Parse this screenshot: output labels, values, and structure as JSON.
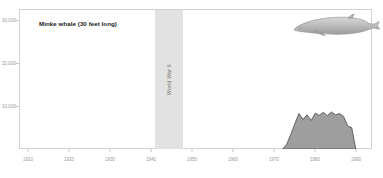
{
  "chart_title": "Minke whale (30 feet long)",
  "annotations": {
    "war_band_label": "World War II",
    "war_band_start": 1940,
    "war_band_end": 1946
  },
  "illustration": {
    "name": "minke-whale-illustration",
    "body_color": "#b4b4b4",
    "outline_color": "#8a8a8a"
  },
  "axes": {
    "y_ticks": [
      "30,000",
      "20,000",
      "10,000"
    ],
    "y_tick_values": [
      30000,
      20000,
      10000
    ],
    "x_ticks": [
      "1910",
      "1920",
      "1930",
      "1940",
      "1950",
      "1960",
      "1970",
      "1980",
      "1990"
    ],
    "x_tick_values": [
      1910,
      1920,
      1930,
      1940,
      1950,
      1960,
      1970,
      1980,
      1990
    ]
  },
  "colors": {
    "area_fill": "#9e9e9e",
    "area_stroke": "#4a4a4a",
    "frame": "#d2d2d2",
    "war_band": "#e2e2e2",
    "tick_text": "#9a9a9a",
    "title_text": "#1a1a1a"
  },
  "chart_data": {
    "type": "area",
    "title": "Minke whale (30 feet long)",
    "xlabel": "",
    "ylabel": "",
    "xlim": [
      1905,
      1992
    ],
    "ylim": [
      0,
      34000
    ],
    "grid": false,
    "legend": "none",
    "series": [
      {
        "name": "Minke whale catch",
        "x": [
          1970,
          1971,
          1972,
          1973,
          1974,
          1975,
          1976,
          1977,
          1978,
          1979,
          1980,
          1981,
          1982,
          1983,
          1984,
          1985,
          1986,
          1987,
          1988
        ],
        "values": [
          0,
          1200,
          3600,
          6200,
          8600,
          7200,
          8300,
          6900,
          8700,
          8200,
          8900,
          8100,
          9000,
          8300,
          8600,
          7900,
          5600,
          5200,
          0
        ]
      }
    ]
  }
}
